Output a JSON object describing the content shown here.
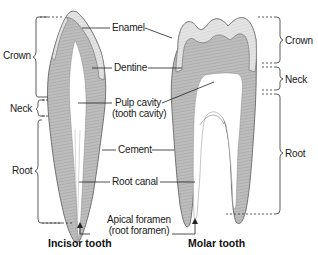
{
  "diagram": {
    "teeth": [
      {
        "id": "incisor",
        "title": "Incisor tooth"
      },
      {
        "id": "molar",
        "title": "Molar tooth"
      }
    ],
    "regions_left": [
      {
        "label": "Crown"
      },
      {
        "label": "Neck"
      },
      {
        "label": "Root"
      }
    ],
    "regions_right": [
      {
        "label": "Crown"
      },
      {
        "label": "Neck"
      },
      {
        "label": "Root"
      }
    ],
    "parts": [
      {
        "label": "Enamel"
      },
      {
        "label": "Dentine"
      },
      {
        "label": "Pulp cavity",
        "sublabel": "(tooth cavity)"
      },
      {
        "label": "Cement"
      },
      {
        "label": "Root canal"
      },
      {
        "label": "Apical foramen",
        "sublabel": "(root foramen)"
      }
    ],
    "colors": {
      "enamel": "#e6e6e6",
      "dentine": "#b9b9b9",
      "outline": "#555555",
      "leader": "#222222",
      "bracket": "#333333",
      "background": "#ffffff"
    }
  }
}
